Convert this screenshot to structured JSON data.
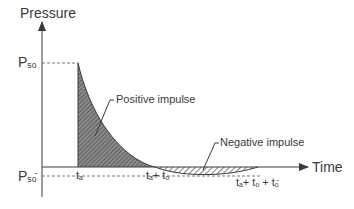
{
  "diagram": {
    "y_axis_label": "Pressure",
    "x_axis_label": "Time",
    "peak_label": {
      "main": "P",
      "sub": "so"
    },
    "negative_peak_label": {
      "main": "P",
      "sub": "so",
      "sup": "-"
    },
    "time_labels": {
      "arrival": {
        "main": "t",
        "sub": "a"
      },
      "positive_end": {
        "t1": "t",
        "s1": "a",
        "plus1": "+ ",
        "t2": "t",
        "s2": "o"
      },
      "negative_end": {
        "t1": "t",
        "s1": "a",
        "plus1": "+ ",
        "t2": "t",
        "s2": "o",
        "plus2": " + ",
        "t3": "t",
        "s3": "o",
        "sup3": "-"
      }
    },
    "annotations": {
      "positive": "Positive impulse",
      "negative": "Negative impulse"
    },
    "colors": {
      "line": "#3a3a3a",
      "fill": "#5a5a5a",
      "dash": "#6a6a6a"
    }
  }
}
